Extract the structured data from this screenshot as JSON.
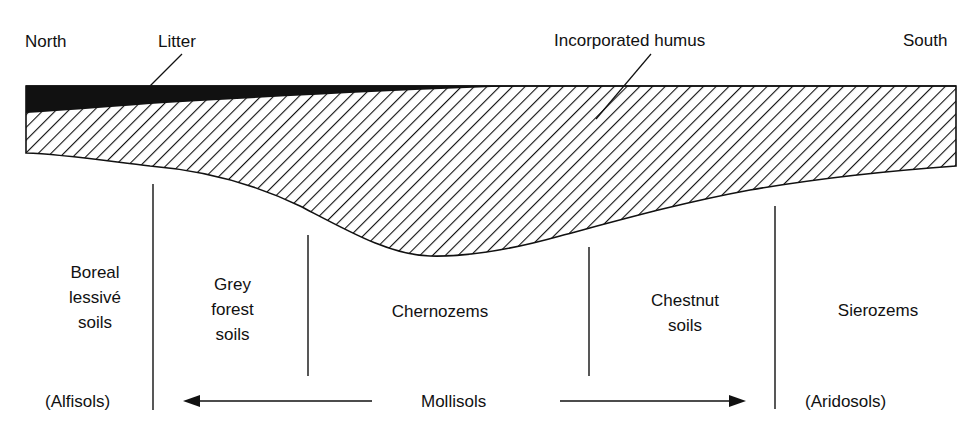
{
  "direction": {
    "north": "North",
    "south": "South"
  },
  "layers": {
    "litter": "Litter",
    "humus": "Incorporated humus"
  },
  "soil_zones": [
    {
      "name": "Boreal lessivé soils",
      "lines": [
        "Boreal",
        "lessivé",
        "soils"
      ]
    },
    {
      "name": "Grey forest soils",
      "lines": [
        "Grey",
        "forest",
        "soils"
      ]
    },
    {
      "name": "Chernozems",
      "lines": [
        "Chernozems"
      ]
    },
    {
      "name": "Chestnut soils",
      "lines": [
        "Chestnut",
        "soils"
      ]
    },
    {
      "name": "Sierozems",
      "lines": [
        "Sierozems"
      ]
    }
  ],
  "soil_orders": {
    "left": "(Alfisols)",
    "middle": "Mollisols",
    "right": "(Aridosols)"
  },
  "colors": {
    "ink": "#111111",
    "background": "#ffffff"
  }
}
